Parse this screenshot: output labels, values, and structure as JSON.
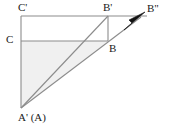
{
  "figure": {
    "labels": {
      "c_prime": "C'",
      "b_prime": "B'",
      "b_double_prime": "B\"",
      "c": "C",
      "b": "B",
      "a_prime_a": "A' (A)"
    },
    "colors": {
      "background": "#ffffff",
      "stroke": "#8c8c8c",
      "stroke_dark": "#7a7a7a",
      "arrow_fill": "#111111",
      "shade_fill": "#f0f0f0",
      "text": "#1a1a1a"
    },
    "points": {
      "c_prime": {
        "x": 21,
        "y": 16
      },
      "b_prime": {
        "x": 108,
        "y": 16
      },
      "c": {
        "x": 21,
        "y": 41
      },
      "b": {
        "x": 108,
        "y": 41
      },
      "a_prime": {
        "x": 21,
        "y": 108
      },
      "arrow_tip": {
        "x": 145,
        "y": 13
      },
      "top_line_end": {
        "x": 147,
        "y": 16
      }
    },
    "segments": [
      {
        "name": "top-edge-cprime-bprime-extended",
        "from": "c_prime",
        "to": "top_line_end"
      },
      {
        "name": "left-edge-cprime-aprime",
        "from": "c_prime",
        "to": "a_prime"
      },
      {
        "name": "mid-horizontal-c-b",
        "from": "c",
        "to": "b"
      },
      {
        "name": "right-edge-bprime-b",
        "from": "b_prime",
        "to": "b"
      },
      {
        "name": "diagonal-aprime-bprime",
        "from": "a_prime",
        "to": "b_prime"
      },
      {
        "name": "diagonal-aprime-b-to-bdoubleprime",
        "from": "a_prime",
        "to": "arrow_tip"
      }
    ],
    "shaded_region": {
      "name": "triangle-aprime-c-b",
      "vertices": [
        "a_prime",
        "c",
        "b"
      ]
    },
    "arrow": {
      "name": "arrowhead-toward-b-double-prime",
      "direction": "up-right"
    }
  }
}
